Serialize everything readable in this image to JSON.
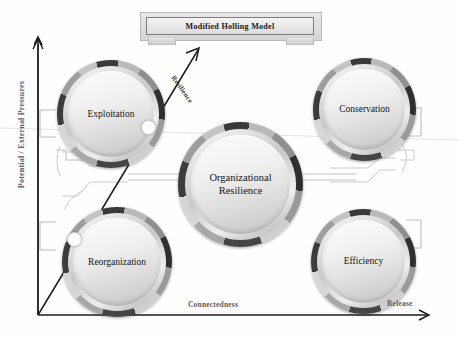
{
  "title": {
    "text": "Modified Holling Model"
  },
  "axes": {
    "y_label": "Potential / External Pressures",
    "x_label": "Connectedness",
    "release_label": "Release",
    "resilience_label": "Resilience"
  },
  "nodes": [
    {
      "id": "exploitation",
      "label": "Exploitation"
    },
    {
      "id": "conservation",
      "label": "Conservation"
    },
    {
      "id": "center",
      "label_line1": "Organizational",
      "label_line2": "Resilience"
    },
    {
      "id": "reorganization",
      "label": "Reorganization"
    },
    {
      "id": "efficiency",
      "label": "Efficiency"
    }
  ],
  "colors": {
    "axis": "#1c1c1c",
    "wire": "#b0b0b0",
    "ring_dark": "#333333",
    "ring_light": "#d6d6d6",
    "marker": "#ffffff",
    "text": "#141414",
    "label_grey": "#5d5d5d"
  },
  "markers": [
    {
      "on": "exploitation",
      "position": "lower-right"
    },
    {
      "on": "reorganization",
      "position": "upper-left"
    }
  ]
}
